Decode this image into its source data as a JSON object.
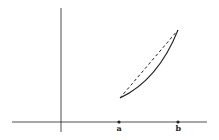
{
  "diagram": {
    "labels": {
      "a": "a",
      "b": "b"
    },
    "colors": {
      "stroke": "#222222",
      "background": "#ffffff"
    },
    "axes": {
      "x_axis": {
        "x1": 12,
        "x2": 207,
        "y": 122
      },
      "y_axis": {
        "x": 61,
        "y1": 8,
        "y2": 132
      }
    },
    "points": {
      "a": {
        "x": 119,
        "y": 122
      },
      "b": {
        "x": 178,
        "y": 122
      }
    },
    "curve": {
      "start": [
        120,
        98
      ],
      "end": [
        178,
        30
      ],
      "control": [
        158,
        80
      ]
    },
    "chord": {
      "start": [
        120,
        98
      ],
      "end": [
        178,
        30
      ],
      "style": "dashed"
    }
  }
}
